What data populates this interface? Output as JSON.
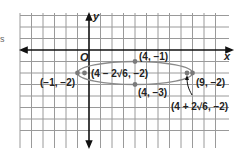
{
  "diagram": {
    "type": "ellipse-graph",
    "edge_fragment": "s",
    "axes": {
      "x_label": "x",
      "y_label": "y",
      "origin_label": "O"
    },
    "grid": {
      "x_min": -6,
      "x_max": 11,
      "y_min": 3,
      "y_max": -7,
      "unit": 1
    },
    "ellipse": {
      "center": [
        4,
        -2
      ],
      "a": 5,
      "b": 1
    },
    "points": [
      {
        "name": "vertex-left",
        "coords": [
          -1,
          -2
        ],
        "label": "(−1, −2)"
      },
      {
        "name": "vertex-right",
        "coords": [
          9,
          -2
        ],
        "label": "(9, −2)"
      },
      {
        "name": "co-vertex-top",
        "coords": [
          4,
          -1
        ],
        "label": "(4, −1)"
      },
      {
        "name": "co-vertex-bottom",
        "coords": [
          4,
          -3
        ],
        "label": "(4, −3)"
      },
      {
        "name": "focus-left",
        "coords": [
          -0.899,
          -2
        ],
        "label": "(4 − 2√6, −2)"
      },
      {
        "name": "focus-right",
        "coords": [
          8.899,
          -2
        ],
        "label": "(4 + 2√6, −2)"
      }
    ]
  }
}
